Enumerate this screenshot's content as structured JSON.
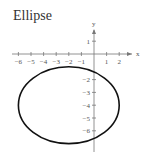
{
  "title": "Ellipse",
  "chart_data": {
    "type": "line",
    "title": "Ellipse",
    "xlabel": "x",
    "ylabel": "y",
    "xlim": [
      -6.5,
      2.7
    ],
    "ylim": [
      -7.3,
      1.8
    ],
    "x_ticks": [
      -6,
      -5,
      -4,
      -3,
      -2,
      -1,
      1,
      2
    ],
    "y_ticks": [
      1,
      -2,
      -3,
      -4,
      -5,
      -6
    ],
    "grid": false,
    "series": [
      {
        "name": "ellipse",
        "shape": "ellipse",
        "center": [
          -2,
          -4
        ],
        "semi_axis_x": 4,
        "semi_axis_y": 3,
        "equation": "(x+2)^2/16 + (y+4)^2/9 = 1"
      }
    ]
  }
}
